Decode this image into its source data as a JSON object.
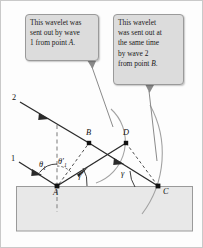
{
  "figure": {
    "background": "#fdfdfd",
    "border_color": "#c9c9c9"
  },
  "callouts": [
    {
      "id": "callout-1",
      "text": "This wavelet was sent out by wave 1 from point A.",
      "line1": "This wavelet was",
      "line2": "sent out by wave",
      "line3_pre": "1 from point ",
      "line3_italic": "A",
      "line3_post": ".",
      "bg": "#dcdcdc",
      "border": "#9a9a9a"
    },
    {
      "id": "callout-2",
      "text": "This wavelet was sent out at the same time by wave 2 from point B.",
      "line1": "This wavelet",
      "line2": "was sent out at",
      "line3": "the same time",
      "line4": "by wave 2",
      "line5_pre": "from point ",
      "line5_italic": "B",
      "line5_post": ".",
      "bg": "#dcdcdc",
      "border": "#9a9a9a"
    }
  ],
  "diagram": {
    "medium_block": {
      "fill": "#e8e8e8",
      "stroke": "#9a9a9a",
      "x": 15,
      "y": 185,
      "width": 177,
      "height": 45
    },
    "interface_y": 185,
    "points": [
      {
        "name": "A",
        "label": "A",
        "x": 56,
        "y": 185
      },
      {
        "name": "B",
        "label": "B",
        "x": 88,
        "y": 142
      },
      {
        "name": "C",
        "label": "C",
        "x": 157,
        "y": 185
      },
      {
        "name": "D",
        "label": "D",
        "x": 125,
        "y": 142
      }
    ],
    "ray_labels": [
      {
        "name": "ray-1",
        "label": "1",
        "x": 10,
        "y": 156
      },
      {
        "name": "ray-2",
        "label": "2",
        "x": 12,
        "y": 96
      }
    ],
    "angle_labels": [
      {
        "name": "theta-1",
        "label": "θ",
        "sub": "1",
        "x": 39,
        "y": 163
      },
      {
        "name": "theta-1-prime",
        "label": "θ′",
        "sub": "1",
        "x": 58,
        "y": 160
      },
      {
        "name": "gamma-prime",
        "label": "γ′",
        "x": 79,
        "y": 176
      },
      {
        "name": "gamma",
        "label": "γ",
        "x": 122,
        "y": 174
      }
    ],
    "stroke_colors": {
      "ray": "#2a2a2a",
      "dashed": "#3a3a3a",
      "normal_dashed": "#8a8a8a",
      "wavelet_arc": "#9a9a9a",
      "leader": "#8a8a8a"
    },
    "wavelet_arcs": [
      {
        "name": "wavelet-from-A",
        "center": "A",
        "radius": 101,
        "description": "large wavelet arc from point A passing through C"
      },
      {
        "name": "wavelet-from-B",
        "center": "B",
        "radius": 44,
        "description": "smaller wavelet arc from point B passing through D"
      }
    ]
  }
}
